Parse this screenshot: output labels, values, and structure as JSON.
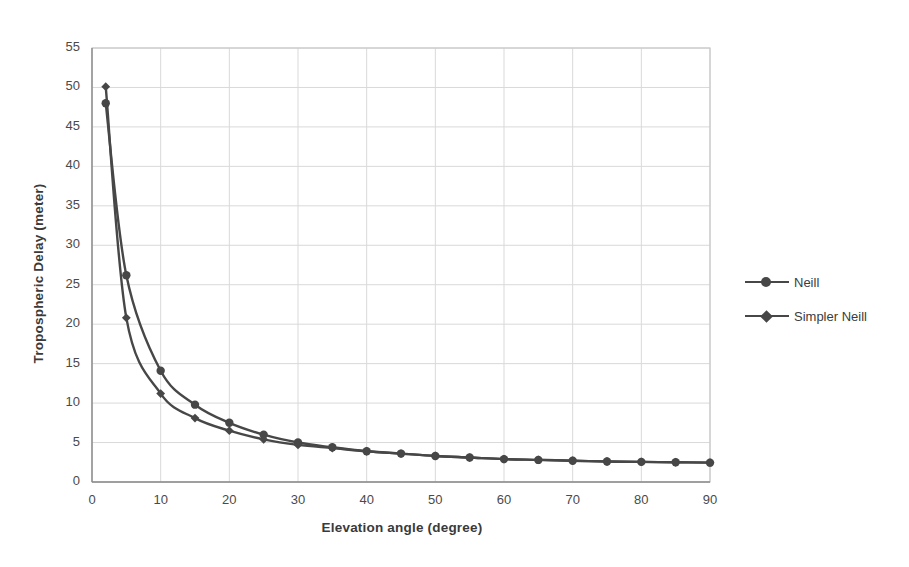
{
  "chart_data": {
    "type": "line",
    "title": "",
    "xlabel": "Elevation angle (degree)",
    "ylabel": "Tropospheric Delay (meter)",
    "xlim": [
      0,
      90
    ],
    "ylim": [
      0,
      55
    ],
    "xticks": [
      0,
      10,
      20,
      30,
      40,
      50,
      60,
      70,
      80,
      90
    ],
    "yticks": [
      0,
      5,
      10,
      15,
      20,
      25,
      30,
      35,
      40,
      45,
      50,
      55
    ],
    "grid": true,
    "legend_position": "right",
    "x": [
      2,
      5,
      10,
      15,
      20,
      25,
      30,
      35,
      40,
      45,
      50,
      55,
      60,
      65,
      70,
      75,
      80,
      85,
      90
    ],
    "series": [
      {
        "name": "Neill",
        "marker": "circle",
        "color": "#474747",
        "values": [
          48.0,
          26.2,
          14.1,
          9.8,
          7.5,
          6.0,
          5.0,
          4.4,
          3.9,
          3.6,
          3.3,
          3.1,
          2.9,
          2.8,
          2.7,
          2.6,
          2.55,
          2.5,
          2.45
        ]
      },
      {
        "name": "Simpler Neill",
        "marker": "diamond",
        "color": "#474747",
        "values": [
          50.1,
          20.8,
          11.2,
          8.1,
          6.5,
          5.4,
          4.7,
          4.3,
          3.9,
          3.6,
          3.3,
          3.1,
          2.9,
          2.8,
          2.7,
          2.6,
          2.55,
          2.5,
          2.45
        ]
      }
    ]
  },
  "legend": {
    "items": [
      {
        "label": "Neill",
        "marker": "circle"
      },
      {
        "label": "Simpler Neill",
        "marker": "diamond"
      }
    ]
  }
}
